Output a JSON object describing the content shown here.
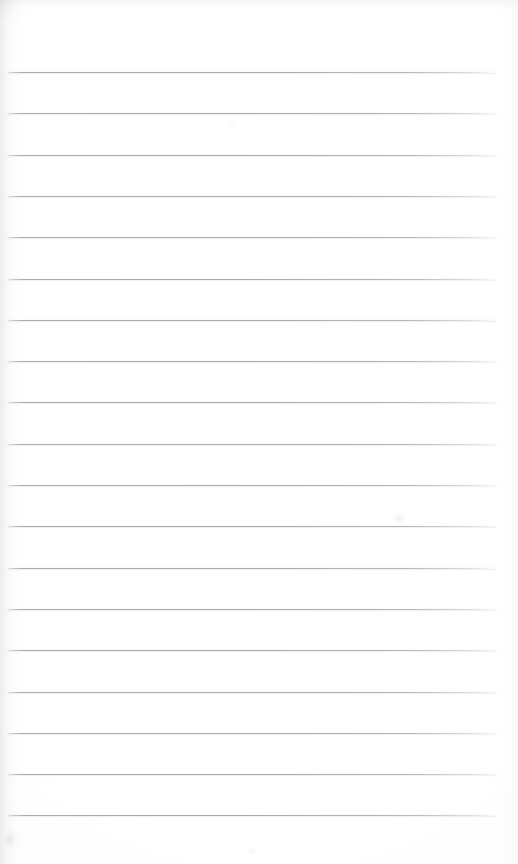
{
  "page": {
    "kind": "scanned-lined-paper",
    "title": "Blank Ruled Notepad Page",
    "width_px": 518,
    "height_px": 864,
    "paper_color": "#fdfdfd",
    "background_color": "#ffffff",
    "written_text": "",
    "margin_rule_present": false,
    "header_text": "",
    "footer_text": "",
    "page_number": ""
  },
  "ruling": {
    "line_color": "#aaaaaa",
    "line_shadow_color": "#cdcdcd",
    "line_count": 19,
    "line_thickness_px": 1,
    "line_spacing_px": 41.3,
    "first_line_y_px": 72,
    "last_line_y_px": 815,
    "line_left_x_px": 7,
    "line_right_x_px": 497,
    "line_length_px": 490,
    "lines": [
      {
        "index": 1,
        "y": 72,
        "content": ""
      },
      {
        "index": 2,
        "y": 113.3,
        "content": ""
      },
      {
        "index": 3,
        "y": 154.6,
        "content": ""
      },
      {
        "index": 4,
        "y": 195.9,
        "content": ""
      },
      {
        "index": 5,
        "y": 237.2,
        "content": ""
      },
      {
        "index": 6,
        "y": 278.5,
        "content": ""
      },
      {
        "index": 7,
        "y": 319.8,
        "content": ""
      },
      {
        "index": 8,
        "y": 361.1,
        "content": ""
      },
      {
        "index": 9,
        "y": 402.4,
        "content": ""
      },
      {
        "index": 10,
        "y": 443.7,
        "content": ""
      },
      {
        "index": 11,
        "y": 485.0,
        "content": ""
      },
      {
        "index": 12,
        "y": 526.3,
        "content": ""
      },
      {
        "index": 13,
        "y": 567.6,
        "content": ""
      },
      {
        "index": 14,
        "y": 608.9,
        "content": ""
      },
      {
        "index": 15,
        "y": 650.2,
        "content": ""
      },
      {
        "index": 16,
        "y": 691.5,
        "content": ""
      },
      {
        "index": 17,
        "y": 732.8,
        "content": ""
      },
      {
        "index": 18,
        "y": 774.1,
        "content": ""
      },
      {
        "index": 19,
        "y": 815.4,
        "content": ""
      }
    ]
  },
  "scan_artifacts": {
    "left_edge_shadow": true,
    "top_edge_shadow": true,
    "right_edge_shadow": true,
    "smudges": [
      {
        "name": "smudge-bottom-left",
        "x": 2,
        "y": 828,
        "w": 16,
        "h": 22
      },
      {
        "name": "smudge-mid-right",
        "x": 392,
        "y": 512,
        "w": 14,
        "h": 12
      },
      {
        "name": "smudge-upper-right",
        "x": 226,
        "y": 118,
        "w": 12,
        "h": 10
      },
      {
        "name": "smudge-bottom-mid",
        "x": 246,
        "y": 846,
        "w": 12,
        "h": 9
      }
    ]
  }
}
